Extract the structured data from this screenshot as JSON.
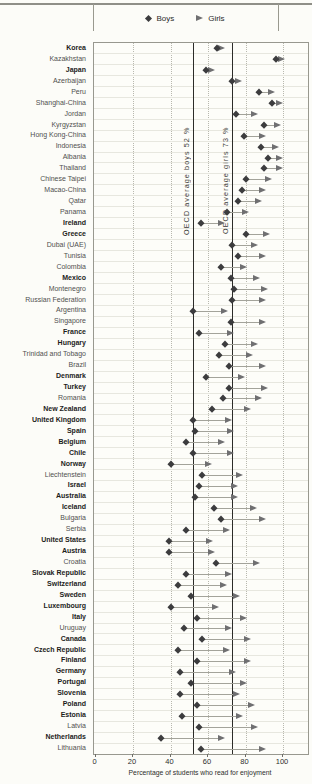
{
  "legend": {
    "boys_label": "Boys",
    "girls_label": "Girls"
  },
  "axis": {
    "ticks": [
      0,
      20,
      40,
      60,
      80,
      100
    ],
    "title": "Percentage of students who read for enjoyment"
  },
  "colors": {
    "boys_marker": "#3c3c3e",
    "girls_marker": "#6f6f71",
    "connector": "#a3a39a",
    "reference_line": "#2c2c29",
    "gridline": "#b8b8ae"
  },
  "chart_data": {
    "type": "scatter",
    "xlabel": "Percentage of students who read for enjoyment",
    "x_ticks": [
      0,
      20,
      40,
      60,
      80,
      100
    ],
    "xlim": [
      0,
      114
    ],
    "grid": "vertical-dotted",
    "legend_position": "top-center",
    "series_labels": [
      "Boys",
      "Girls"
    ],
    "reference_lines": [
      {
        "name": "oecd-average-boys",
        "label": "OECD average boys 52 %",
        "value": 52
      },
      {
        "name": "oecd-average-girls",
        "label": "OECD average girls 73 %",
        "value": 73
      }
    ],
    "rows": [
      {
        "country": "Korea",
        "oecd": true,
        "boys": 65,
        "girls": 67
      },
      {
        "country": "Kazakhstan",
        "oecd": false,
        "boys": 96,
        "girls": 99
      },
      {
        "country": "Japan",
        "oecd": true,
        "boys": 59,
        "girls": 62
      },
      {
        "country": "Azerbaijan",
        "oecd": false,
        "boys": 73,
        "girls": 76
      },
      {
        "country": "Peru",
        "oecd": false,
        "boys": 87,
        "girls": 94
      },
      {
        "country": "Shanghai-China",
        "oecd": false,
        "boys": 94,
        "girls": 98
      },
      {
        "country": "Jordan",
        "oecd": false,
        "boys": 75,
        "girls": 85
      },
      {
        "country": "Kyrgyzstan",
        "oecd": false,
        "boys": 90,
        "girls": 97
      },
      {
        "country": "Hong Kong-China",
        "oecd": false,
        "boys": 79,
        "girls": 89
      },
      {
        "country": "Indonesia",
        "oecd": false,
        "boys": 88,
        "girls": 96
      },
      {
        "country": "Albania",
        "oecd": false,
        "boys": 92,
        "girls": 98
      },
      {
        "country": "Thailand",
        "oecd": false,
        "boys": 90,
        "girls": 98
      },
      {
        "country": "Chinese Taipei",
        "oecd": false,
        "boys": 80,
        "girls": 92
      },
      {
        "country": "Macao-China",
        "oecd": false,
        "boys": 78,
        "girls": 89
      },
      {
        "country": "Qatar",
        "oecd": false,
        "boys": 76,
        "girls": 87
      },
      {
        "country": "Panama",
        "oecd": false,
        "boys": 70,
        "girls": 80
      },
      {
        "country": "Ireland",
        "oecd": true,
        "boys": 56,
        "girls": 67
      },
      {
        "country": "Greece",
        "oecd": true,
        "boys": 80,
        "girls": 91
      },
      {
        "country": "Dubai (UAE)",
        "oecd": false,
        "boys": 73,
        "girls": 85
      },
      {
        "country": "Tunisia",
        "oecd": false,
        "boys": 76,
        "girls": 89
      },
      {
        "country": "Colombia",
        "oecd": false,
        "boys": 67,
        "girls": 79
      },
      {
        "country": "Mexico",
        "oecd": true,
        "boys": 72,
        "girls": 86
      },
      {
        "country": "Montenegro",
        "oecd": false,
        "boys": 74,
        "girls": 90
      },
      {
        "country": "Russian Federation",
        "oecd": false,
        "boys": 73,
        "girls": 89
      },
      {
        "country": "Argentina",
        "oecd": false,
        "boys": 52,
        "girls": 69
      },
      {
        "country": "Singapore",
        "oecd": false,
        "boys": 72,
        "girls": 89
      },
      {
        "country": "France",
        "oecd": true,
        "boys": 55,
        "girls": 72
      },
      {
        "country": "Hungary",
        "oecd": true,
        "boys": 69,
        "girls": 85
      },
      {
        "country": "Trinidad and Tobago",
        "oecd": false,
        "boys": 66,
        "girls": 82
      },
      {
        "country": "Brazil",
        "oecd": false,
        "boys": 71,
        "girls": 89
      },
      {
        "country": "Denmark",
        "oecd": true,
        "boys": 59,
        "girls": 78
      },
      {
        "country": "Turkey",
        "oecd": true,
        "boys": 71,
        "girls": 90
      },
      {
        "country": "Romania",
        "oecd": false,
        "boys": 68,
        "girls": 87
      },
      {
        "country": "New Zealand",
        "oecd": true,
        "boys": 62,
        "girls": 81
      },
      {
        "country": "United Kingdom",
        "oecd": true,
        "boys": 52,
        "girls": 71
      },
      {
        "country": "Spain",
        "oecd": true,
        "boys": 53,
        "girls": 72
      },
      {
        "country": "Belgium",
        "oecd": true,
        "boys": 48,
        "girls": 67
      },
      {
        "country": "Chile",
        "oecd": true,
        "boys": 52,
        "girls": 72
      },
      {
        "country": "Norway",
        "oecd": true,
        "boys": 40,
        "girls": 60
      },
      {
        "country": "Liechtenstein",
        "oecd": false,
        "boys": 57,
        "girls": 77
      },
      {
        "country": "Israel",
        "oecd": true,
        "boys": 55,
        "girls": 74
      },
      {
        "country": "Australia",
        "oecd": true,
        "boys": 53,
        "girls": 74
      },
      {
        "country": "Iceland",
        "oecd": true,
        "boys": 63,
        "girls": 84
      },
      {
        "country": "Bulgaria",
        "oecd": false,
        "boys": 67,
        "girls": 89
      },
      {
        "country": "Serbia",
        "oecd": false,
        "boys": 48,
        "girls": 70
      },
      {
        "country": "United States",
        "oecd": true,
        "boys": 39,
        "girls": 61
      },
      {
        "country": "Austria",
        "oecd": true,
        "boys": 39,
        "girls": 62
      },
      {
        "country": "Croatia",
        "oecd": false,
        "boys": 64,
        "girls": 86
      },
      {
        "country": "Slovak Republic",
        "oecd": true,
        "boys": 48,
        "girls": 71
      },
      {
        "country": "Switzerland",
        "oecd": true,
        "boys": 44,
        "girls": 68
      },
      {
        "country": "Sweden",
        "oecd": true,
        "boys": 51,
        "girls": 75
      },
      {
        "country": "Luxembourg",
        "oecd": true,
        "boys": 40,
        "girls": 64
      },
      {
        "country": "Italy",
        "oecd": true,
        "boys": 54,
        "girls": 79
      },
      {
        "country": "Uruguay",
        "oecd": false,
        "boys": 47,
        "girls": 71
      },
      {
        "country": "Canada",
        "oecd": true,
        "boys": 57,
        "girls": 81
      },
      {
        "country": "Czech Republic",
        "oecd": true,
        "boys": 44,
        "girls": 70
      },
      {
        "country": "Finland",
        "oecd": true,
        "boys": 54,
        "girls": 81
      },
      {
        "country": "Germany",
        "oecd": true,
        "boys": 45,
        "girls": 73
      },
      {
        "country": "Portugal",
        "oecd": true,
        "boys": 51,
        "girls": 79
      },
      {
        "country": "Slovenia",
        "oecd": true,
        "boys": 45,
        "girls": 75
      },
      {
        "country": "Poland",
        "oecd": true,
        "boys": 54,
        "girls": 83
      },
      {
        "country": "Estonia",
        "oecd": true,
        "boys": 46,
        "girls": 77
      },
      {
        "country": "Latvia",
        "oecd": false,
        "boys": 55,
        "girls": 85
      },
      {
        "country": "Netherlands",
        "oecd": true,
        "boys": 35,
        "girls": 67
      },
      {
        "country": "Lithuania",
        "oecd": false,
        "boys": 56,
        "girls": 89
      }
    ]
  }
}
